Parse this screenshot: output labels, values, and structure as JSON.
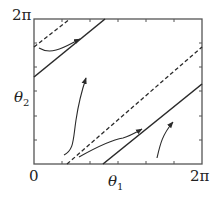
{
  "diagram": {
    "type": "phase-portrait",
    "axes": {
      "x_label": "θ",
      "x_label_sub": "1",
      "y_label": "θ",
      "y_label_sub": "2",
      "x_min_label": "0",
      "x_max_label": "2π",
      "y_max_label": "2π",
      "range": [
        0,
        "2π"
      ]
    },
    "lines": [
      {
        "style": "solid",
        "from": [
          0,
          1.26
        ],
        "to": [
          2.69,
          "2π"
        ]
      },
      {
        "style": "dashed",
        "from": [
          0,
          2.57
        ],
        "to": [
          1.33,
          "2π"
        ]
      },
      {
        "style": "dashed",
        "from": [
          1.24,
          0
        ],
        "to": [
          "2π",
          5.06
        ]
      },
      {
        "style": "solid",
        "from": [
          2.58,
          0
        ],
        "to": [
          "2π",
          3.48
        ]
      }
    ],
    "trajectories": 4
  },
  "colors": {
    "ink": "#2a2a2a",
    "background": "#ffffff"
  }
}
